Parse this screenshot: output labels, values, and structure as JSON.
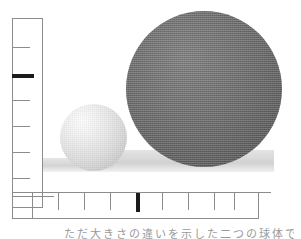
{
  "figure": {
    "background_color": "#ffffff",
    "caption_text": "ただ大きさの違いを示した二つの球体である",
    "caption_note": "caption clipped at bottom edge of image"
  },
  "objects": {
    "large_sphere": {
      "name": "large dark sphere",
      "fill_color": "#6b6b6b",
      "highlight_color": "#7e7e7e",
      "shade_color": "#565656",
      "center_x": 204,
      "center_y": 89,
      "diameter": 156,
      "texture": "halftone-dither"
    },
    "small_sphere": {
      "name": "small light sphere",
      "fill_color": "#dcdcdc",
      "highlight_color": "#fbfbfb",
      "shade_color": "#bcbcbc",
      "center_x": 94,
      "center_y": 138,
      "diameter": 67,
      "texture": "halftone-dither"
    },
    "ground_plane": {
      "name": "ground plane",
      "fill_color": "#dcdcdc",
      "left_top_y": 158,
      "right_top_y": 150,
      "bottom_y": 172
    }
  },
  "vertical_ruler": {
    "label": "vertical scale bar",
    "line_color": "#8c8c8c",
    "major_tick_color": "#1c1c1c",
    "x": 12,
    "y": 18,
    "width": 31,
    "height": 190,
    "ticks": [
      {
        "y": 47,
        "length": 18,
        "major": false
      },
      {
        "y": 74,
        "length": 22,
        "major": true
      },
      {
        "y": 100,
        "length": 18,
        "major": false
      },
      {
        "y": 126,
        "length": 18,
        "major": false
      },
      {
        "y": 152,
        "length": 18,
        "major": false
      },
      {
        "y": 178,
        "length": 18,
        "major": false
      },
      {
        "y": 196,
        "length": 42,
        "major": false
      }
    ]
  },
  "horizontal_ruler": {
    "label": "horizontal scale bar",
    "line_color": "#8c8c8c",
    "major_tick_color": "#1c1c1c",
    "x": 12,
    "y": 192,
    "width": 247,
    "height": 27,
    "ticks": [
      {
        "x": 32,
        "length": 26,
        "major": false
      },
      {
        "x": 58,
        "length": 18,
        "major": false
      },
      {
        "x": 84,
        "length": 18,
        "major": false
      },
      {
        "x": 110,
        "length": 18,
        "major": false
      },
      {
        "x": 136,
        "length": 20,
        "major": true
      },
      {
        "x": 162,
        "length": 18,
        "major": false
      },
      {
        "x": 188,
        "length": 18,
        "major": false
      },
      {
        "x": 214,
        "length": 18,
        "major": false
      },
      {
        "x": 234,
        "length": 18,
        "major": false
      }
    ]
  }
}
